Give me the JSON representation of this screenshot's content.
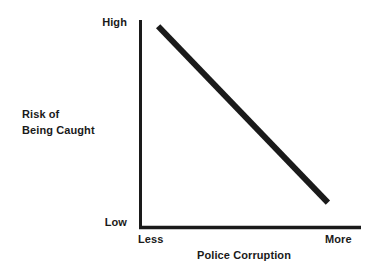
{
  "figure": {
    "background_color": "#ffffff",
    "ink_color": "#1a1a1a"
  },
  "axes": {
    "y_title_line1": "Risk of",
    "y_title_line2": "Being Caught",
    "y_tick_top": "High",
    "y_tick_bottom": "Low",
    "x_title": "Police Corruption",
    "x_tick_left": "Less",
    "x_tick_right": "More"
  },
  "chart_data": {
    "type": "line",
    "title": "",
    "subtitle": "",
    "xlabel": "Police Corruption",
    "ylabel": "Risk of Being Caught",
    "x_tick_labels": [
      "Less",
      "More"
    ],
    "y_tick_labels": [
      "Low",
      "High"
    ],
    "xlim": [
      0,
      1
    ],
    "ylim": [
      0,
      1
    ],
    "grid": false,
    "legend": null,
    "annotations": [],
    "series": [
      {
        "name": "Risk of Being Caught vs Police Corruption",
        "color": "#1a1a1a",
        "linewidth": 6,
        "x": [
          0.08,
          0.85
        ],
        "y": [
          0.97,
          0.12
        ]
      }
    ]
  }
}
